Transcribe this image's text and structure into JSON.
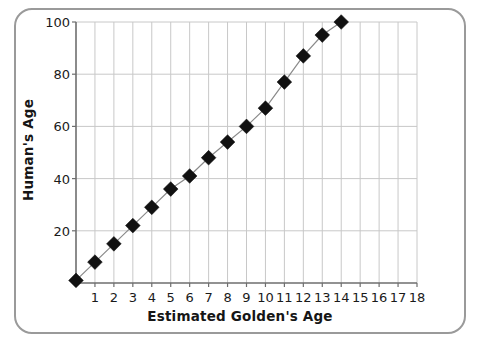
{
  "figure": {
    "border_color": "#9a9a9a",
    "background": "#ffffff"
  },
  "chart_data": {
    "type": "line",
    "title": "",
    "xlabel": "Estimated Golden's Age",
    "ylabel": "Human's Age",
    "xlim": [
      0,
      18
    ],
    "ylim": [
      0,
      100
    ],
    "xticks": [
      1,
      2,
      3,
      4,
      5,
      6,
      7,
      8,
      9,
      10,
      11,
      12,
      13,
      14,
      15,
      16,
      17,
      18
    ],
    "yticks": [
      20,
      40,
      60,
      80,
      100
    ],
    "xtick_labels": [
      "1",
      "2",
      "3",
      "4",
      "5",
      "6",
      "7",
      "8",
      "9",
      "10",
      "11",
      "12",
      "13",
      "14",
      "15",
      "16",
      "17",
      "18"
    ],
    "ytick_labels": [
      "20",
      "40",
      "60",
      "80",
      "100"
    ],
    "grid": true,
    "grid_color": "#c8c8c8",
    "legend": "none",
    "marker": "diamond",
    "marker_color": "#111111",
    "line_color": "#8a8a8a",
    "x": [
      0,
      1,
      2,
      3,
      4,
      5,
      6,
      7,
      8,
      9,
      10,
      11,
      12,
      13,
      14
    ],
    "values": [
      1,
      8,
      15,
      22,
      29,
      36,
      41,
      48,
      54,
      60,
      67,
      77,
      87,
      95,
      100
    ],
    "series": [
      {
        "name": "Golden Retriever age conversion",
        "x": [
          0,
          1,
          2,
          3,
          4,
          5,
          6,
          7,
          8,
          9,
          10,
          11,
          12,
          13,
          14
        ],
        "values": [
          1,
          8,
          15,
          22,
          29,
          36,
          41,
          48,
          54,
          60,
          67,
          77,
          87,
          95,
          100
        ]
      }
    ]
  }
}
